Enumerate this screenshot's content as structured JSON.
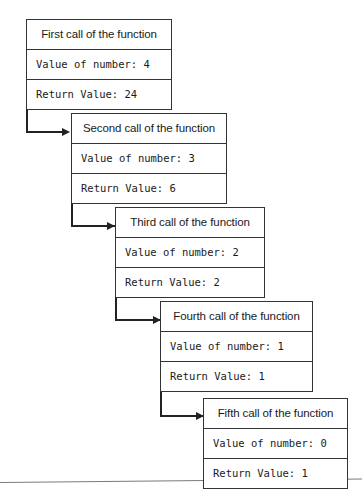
{
  "diagram": {
    "type": "flowchart",
    "labels": {
      "value_prefix": "Value of number:",
      "return_prefix": "Return Value:"
    },
    "calls": [
      {
        "id": "first",
        "title": "First call of the function",
        "value_row": "Value of number: 4",
        "return_row": "Return Value: 24",
        "number": 4,
        "return_value": 24
      },
      {
        "id": "second",
        "title": "Second call of the function",
        "value_row": "Value of number: 3",
        "return_row": "Return Value: 6",
        "number": 3,
        "return_value": 6
      },
      {
        "id": "third",
        "title": "Third call of the function",
        "value_row": "Value of number: 2",
        "return_row": "Return Value: 2",
        "number": 2,
        "return_value": 2
      },
      {
        "id": "fourth",
        "title": "Fourth call of the function",
        "value_row": "Value of number: 1",
        "return_row": "Return Value: 1",
        "number": 1,
        "return_value": 1
      },
      {
        "id": "fifth",
        "title": "Fifth call of the function",
        "value_row": "Value of number: 0",
        "return_row": "Return Value: 1",
        "number": 0,
        "return_value": 1
      }
    ],
    "connectors": [
      {
        "from": "first",
        "to": "second",
        "style": "elbow-arrow"
      },
      {
        "from": "second",
        "to": "third",
        "style": "elbow-arrow"
      },
      {
        "from": "third",
        "to": "fourth",
        "style": "elbow-arrow"
      },
      {
        "from": "fourth",
        "to": "fifth",
        "style": "elbow-arrow"
      }
    ],
    "colors": {
      "border": "#333333",
      "connector": "#222222",
      "text": "#1a1a1a",
      "background": "#ffffff",
      "rule": "#7a7a7a"
    }
  }
}
